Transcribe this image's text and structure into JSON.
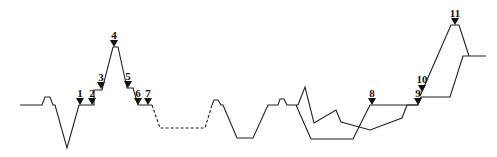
{
  "diagram": {
    "type": "profile-line-diagram",
    "baseline_y": 105,
    "line_color": "#222222",
    "markers": [
      {
        "label": "1",
        "x": 80,
        "y": 105,
        "label_y": 97
      },
      {
        "label": "2",
        "x": 92,
        "y": 105,
        "label_y": 97
      },
      {
        "label": "3",
        "x": 101,
        "y": 89,
        "label_y": 81
      },
      {
        "label": "4",
        "x": 114,
        "y": 47,
        "label_y": 39
      },
      {
        "label": "5",
        "x": 128,
        "y": 88,
        "label_y": 80
      },
      {
        "label": "6",
        "x": 138,
        "y": 105,
        "label_y": 97
      },
      {
        "label": "7",
        "x": 148,
        "y": 105,
        "label_y": 97
      },
      {
        "label": "8",
        "x": 372,
        "y": 105,
        "label_y": 97
      },
      {
        "label": "9",
        "x": 418,
        "y": 105,
        "label_y": 97
      },
      {
        "label": "10",
        "x": 422,
        "y": 92,
        "label_y": 83
      },
      {
        "label": "11",
        "x": 455,
        "y": 25,
        "label_y": 17
      }
    ]
  }
}
